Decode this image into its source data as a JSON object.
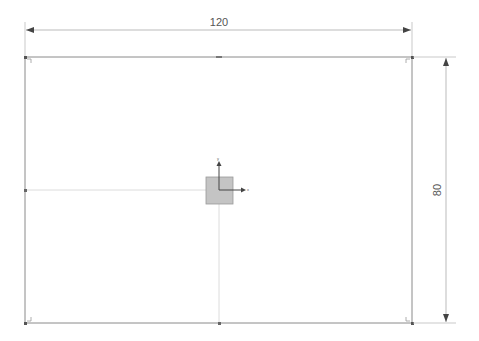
{
  "sketch": {
    "rectangle": {
      "x1": 25,
      "y1": 57,
      "x2": 412,
      "y2": 323,
      "stroke": "#8a8a8a"
    },
    "centerlines": {
      "stroke": "#dcdcdc"
    },
    "origin_box": {
      "x": 206,
      "y": 177,
      "size": 27,
      "fill": "#c4c4c4",
      "stroke": "#9a9a9a"
    },
    "axes": {
      "x_label": "x",
      "y_label": "y",
      "color": "#555555"
    }
  },
  "dimensions": {
    "width": {
      "label": "120"
    },
    "height": {
      "label": "80"
    }
  }
}
